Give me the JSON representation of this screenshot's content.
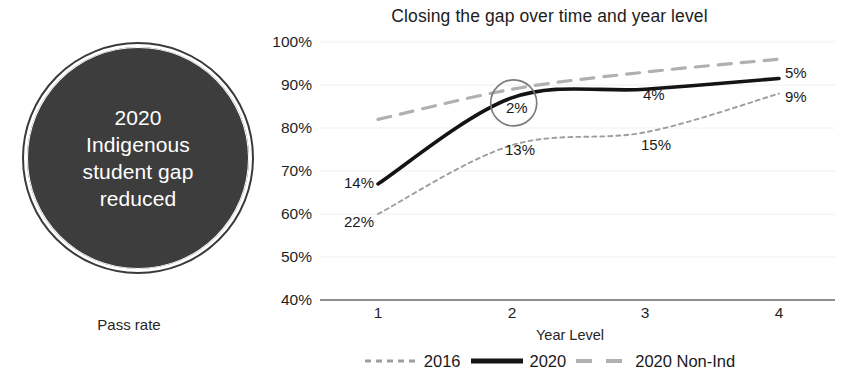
{
  "callout": {
    "headline": "2020\nIndigenous\nstudent gap\nreduced",
    "caption": "Pass rate"
  },
  "chart_data": {
    "type": "line",
    "title": "Closing the gap over time and year level",
    "xlabel": "Year Level",
    "ylabel": "",
    "x": [
      1,
      2,
      3,
      4
    ],
    "categories": [
      "1",
      "2",
      "3",
      "4"
    ],
    "xtick_labels": [
      "1",
      "2",
      "3",
      "4"
    ],
    "ytick_labels": [
      "40%",
      "50%",
      "60%",
      "70%",
      "80%",
      "90%",
      "100%"
    ],
    "ylim": [
      40,
      100
    ],
    "xlim": [
      1,
      4
    ],
    "grid": true,
    "legend_position": "bottom",
    "series": [
      {
        "name": "2016",
        "style": "dotted",
        "color": "#9e9e9e",
        "values": [
          60,
          76,
          79,
          88
        ]
      },
      {
        "name": "2020",
        "style": "solid",
        "color": "#141414",
        "values": [
          67,
          87,
          89,
          91.5
        ]
      },
      {
        "name": "2020 Non-Ind",
        "style": "dashed",
        "color": "#b0b0b0",
        "values": [
          82,
          89,
          93,
          96
        ]
      }
    ],
    "annotations": [
      {
        "text": "14%",
        "note": "gap at year 1 in 2020"
      },
      {
        "text": "22%",
        "note": "gap at year 1 in 2016"
      },
      {
        "text": "2%",
        "note": "gap at year 2 in 2020 (circled)"
      },
      {
        "text": "13%",
        "note": "gap at year 2 in 2016"
      },
      {
        "text": "4%",
        "note": "gap at year 3 in 2020"
      },
      {
        "text": "15%",
        "note": "gap at year 3 in 2016"
      },
      {
        "text": "5%",
        "note": "gap at year 4 in 2020"
      },
      {
        "text": "9%",
        "note": "gap at year 4 in 2016"
      }
    ],
    "highlight_circle": {
      "label": "2%"
    }
  },
  "legend": {
    "items": [
      {
        "label": "2016"
      },
      {
        "label": "2020"
      },
      {
        "label": "2020 Non-Ind"
      }
    ]
  },
  "colors": {
    "callout_fill": "#3d3d3d",
    "callout_text": "#ffffff",
    "series_2016": "#9e9e9e",
    "series_2020": "#141414",
    "series_nonind": "#b0b0b0",
    "grid": "#f0f0f0",
    "axis": "#6b6b6b"
  }
}
